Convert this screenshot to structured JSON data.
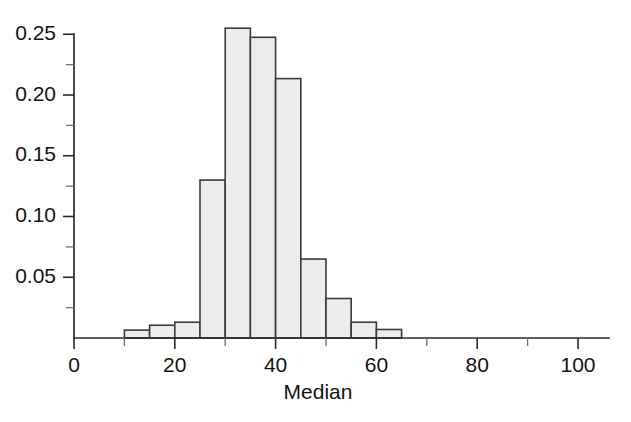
{
  "chart_data": {
    "type": "bar",
    "title": "",
    "subtitle": "",
    "xlabel": "Median",
    "ylabel": "",
    "xlim": [
      0,
      105
    ],
    "ylim": [
      0,
      0.262
    ],
    "grid": false,
    "legend": null,
    "bin_width": 5,
    "x_major_ticks": [
      0,
      20,
      40,
      60,
      80,
      100
    ],
    "x_major_tick_labels": [
      "0",
      "20",
      "40",
      "60",
      "80",
      "100"
    ],
    "x_minor_ticks": [
      10,
      30,
      50,
      70,
      90
    ],
    "y_major_ticks": [
      0.05,
      0.1,
      0.15,
      0.2,
      0.25
    ],
    "y_major_tick_labels": [
      "0.05",
      "0.10",
      "0.15",
      "0.20",
      "0.25"
    ],
    "y_minor_ticks": [
      0.025,
      0.075,
      0.125,
      0.175,
      0.225
    ],
    "bins": [
      {
        "x0": 10,
        "x1": 15,
        "value": 0.0065
      },
      {
        "x0": 15,
        "x1": 20,
        "value": 0.0105
      },
      {
        "x0": 20,
        "x1": 25,
        "value": 0.013
      },
      {
        "x0": 25,
        "x1": 30,
        "value": 0.13
      },
      {
        "x0": 30,
        "x1": 35,
        "value": 0.255
      },
      {
        "x0": 35,
        "x1": 40,
        "value": 0.2475
      },
      {
        "x0": 40,
        "x1": 45,
        "value": 0.2135
      },
      {
        "x0": 45,
        "x1": 50,
        "value": 0.065
      },
      {
        "x0": 50,
        "x1": 55,
        "value": 0.0325
      },
      {
        "x0": 55,
        "x1": 60,
        "value": 0.013
      },
      {
        "x0": 60,
        "x1": 65,
        "value": 0.007
      }
    ],
    "categories": [
      "10-15",
      "15-20",
      "20-25",
      "25-30",
      "30-35",
      "35-40",
      "40-45",
      "45-50",
      "50-55",
      "55-60",
      "60-65"
    ],
    "values": [
      0.0065,
      0.0105,
      0.013,
      0.13,
      0.255,
      0.2475,
      0.2135,
      0.065,
      0.0325,
      0.013,
      0.007
    ],
    "colors": {
      "bar_fill": "#ececec",
      "bar_stroke": "#3b3b3b",
      "axis": "#2b2b2b",
      "text": "#131313",
      "background": "#ffffff"
    }
  }
}
